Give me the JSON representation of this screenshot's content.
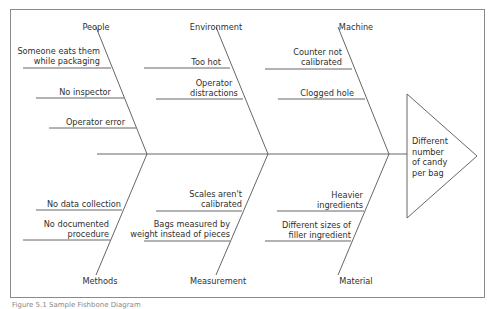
{
  "diagram": {
    "type": "fishbone",
    "effect": "Different number of candy per bag",
    "effect_lines": [
      "Different",
      "number",
      "of candy",
      "per bag"
    ],
    "categories": {
      "people": {
        "label": "People",
        "causes": [
          {
            "lines": [
              "Someone eats them",
              "while packaging"
            ]
          },
          {
            "lines": [
              "No inspector"
            ]
          },
          {
            "lines": [
              "Operator error"
            ]
          }
        ]
      },
      "environment": {
        "label": "Environment",
        "causes": [
          {
            "lines": [
              "Too hot"
            ]
          },
          {
            "lines": [
              "Operator",
              "distractions"
            ]
          }
        ]
      },
      "machine": {
        "label": "Machine",
        "causes": [
          {
            "lines": [
              "Counter not",
              "calibrated"
            ]
          },
          {
            "lines": [
              "Clogged hole"
            ]
          }
        ]
      },
      "methods": {
        "label": "Methods",
        "causes": [
          {
            "lines": [
              "No data collection"
            ]
          },
          {
            "lines": [
              "No documented",
              "procedure"
            ]
          }
        ]
      },
      "measurement": {
        "label": "Measurement",
        "causes": [
          {
            "lines": [
              "Scales aren't",
              "calibrated"
            ]
          },
          {
            "lines": [
              "Bags measured by",
              "weight instead of pieces"
            ]
          }
        ]
      },
      "material": {
        "label": "Material",
        "causes": [
          {
            "lines": [
              "Heavier",
              "ingredients"
            ]
          },
          {
            "lines": [
              "Different sizes of",
              "filler ingredient"
            ]
          }
        ]
      }
    },
    "caption": "Figure 5.1 Sample Fishbone Diagram"
  }
}
